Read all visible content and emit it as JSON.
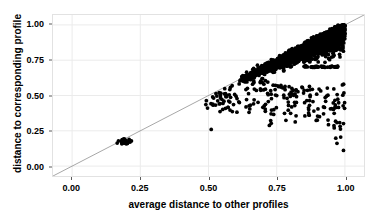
{
  "chart_data": {
    "type": "scatter",
    "title": "",
    "subtitle": "",
    "xlabel": "average distance to other profiles",
    "ylabel": "distance to corresponding profile",
    "xlim": [
      -0.07,
      1.07
    ],
    "ylim": [
      -0.07,
      1.07
    ],
    "xticks": [
      0.0,
      0.25,
      0.5,
      0.75,
      1.0
    ],
    "yticks": [
      0.0,
      0.25,
      0.5,
      0.75,
      1.0
    ],
    "xtick_labels": [
      "0.00",
      "0.25",
      "0.50",
      "0.75",
      "1.00"
    ],
    "ytick_labels": [
      "0.00",
      "0.25",
      "0.50",
      "0.75",
      "1.00"
    ],
    "grid": true,
    "grid_color": "#ebebeb",
    "panel_background": "#ffffff",
    "panel_border_color": "#e2e2e2",
    "legend": null,
    "legend_position": "none",
    "point_color": "#000000",
    "point_radius": 1.9,
    "annotations": [
      {
        "name": "identity-line",
        "type": "line",
        "description": "grey y = x reference line spanning the full panel",
        "from": [
          -0.07,
          -0.07
        ],
        "to": [
          1.07,
          1.07
        ],
        "color": "#808080",
        "width": 0.7
      }
    ],
    "series": [
      {
        "name": "profiles",
        "description": "each point is one profile: average distance to other profiles (x) vs distance to its corresponding profile (y)",
        "n_points_visible": 2600,
        "clusters": [
          {
            "name": "low-distance-cluster",
            "x_center": 0.192,
            "y_center": 0.175,
            "x_spread": 0.016,
            "y_spread": 0.022,
            "count": 26,
            "shape": "tight-blob-on-diagonal"
          },
          {
            "name": "main-diagonal-band",
            "x_range": [
              0.6,
              1.0
            ],
            "y_range": [
              0.44,
              1.0
            ],
            "count": 2300,
            "shape": "dense-elongated-band-below-identity-line",
            "description": "very dense saturated black mass hugging the y=x line from about 0.62 to 1.00, widening downwards toward high x"
          },
          {
            "name": "mid-sparse-tail",
            "x_range": [
              0.49,
              0.72
            ],
            "y_range": [
              0.38,
              0.62
            ],
            "count": 90,
            "shape": "sparse-scatter-below-diagonal"
          },
          {
            "name": "lower-right-outliers",
            "x_range": [
              0.72,
              1.0
            ],
            "y_range": [
              0.28,
              0.58
            ],
            "count": 110,
            "shape": "sparse-scatter"
          },
          {
            "name": "horizontal-band-0.70",
            "x_range": [
              0.845,
              0.975
            ],
            "y_range": [
              0.695,
              0.712
            ],
            "count": 45,
            "shape": "thin-horizontal-streak",
            "description": "a narrow horizontal line of points at y approximately 0.70"
          },
          {
            "name": "far-right-vertical-tail",
            "x_range": [
              0.955,
              0.995
            ],
            "y_range": [
              0.1,
              0.45
            ],
            "count": 14,
            "shape": "near-vertical-string-of-outliers"
          },
          {
            "name": "isolated-low-point",
            "x_range": [
              0.505,
              0.515
            ],
            "y_range": [
              0.255,
              0.265
            ],
            "count": 1,
            "shape": "single-isolated-outlier"
          }
        ]
      }
    ]
  },
  "axes": {
    "x": {
      "title": "average distance to other profiles",
      "ticks": [
        {
          "value": 0.0,
          "label": "0.00"
        },
        {
          "value": 0.25,
          "label": "0.25"
        },
        {
          "value": 0.5,
          "label": "0.50"
        },
        {
          "value": 0.75,
          "label": "0.75"
        },
        {
          "value": 1.0,
          "label": "1.00"
        }
      ]
    },
    "y": {
      "title": "distance to corresponding profile",
      "ticks": [
        {
          "value": 0.0,
          "label": "0.00"
        },
        {
          "value": 0.25,
          "label": "0.25"
        },
        {
          "value": 0.5,
          "label": "0.50"
        },
        {
          "value": 0.75,
          "label": "0.75"
        },
        {
          "value": 1.0,
          "label": "1.00"
        }
      ]
    }
  },
  "colors": {
    "point": "#000000",
    "identity_line": "#808080",
    "grid": "#ebebeb",
    "panel_border": "#e2e2e2",
    "text": "#000000",
    "background": "#ffffff"
  }
}
